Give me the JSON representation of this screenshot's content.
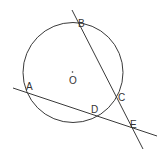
{
  "diagram": {
    "type": "geometry",
    "circle": {
      "center_label": "O"
    },
    "points": {
      "A": "A",
      "B": "B",
      "C": "C",
      "D": "D",
      "E": "E",
      "O": "O"
    },
    "lines": [
      {
        "name": "secant-BE",
        "through": [
          "B",
          "C",
          "E"
        ]
      },
      {
        "name": "secant-AE",
        "through": [
          "A",
          "D",
          "E"
        ]
      }
    ],
    "colors": {
      "stroke": "#3a3a3a",
      "label": "#333333",
      "background": "#ffffff"
    }
  }
}
